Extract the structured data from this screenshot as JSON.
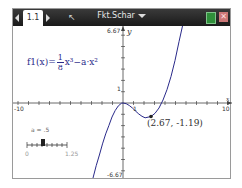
{
  "titlebar": {
    "tab_label": "1.1",
    "doc_title": "Fkt.Schar",
    "close_glyph": "✕",
    "cursor_glyph": "↖"
  },
  "graph": {
    "y_max_label": "6.67",
    "y_min_label": "-6.67",
    "x_min_label": "-10",
    "x_max_label": "10",
    "y_axis_label": "y",
    "x_axis_label": "x",
    "y_tick_label": "1",
    "x_tick_label": "1"
  },
  "function": {
    "name": "f1(x)=",
    "numerator": "1",
    "denominator": "8",
    "rest": "x³−a·x²",
    "color": "#2a2a8a"
  },
  "point": {
    "label": "(2.67, -1.19)"
  },
  "slider": {
    "label": "a = .5",
    "min": "0",
    "max": "1.25"
  }
}
